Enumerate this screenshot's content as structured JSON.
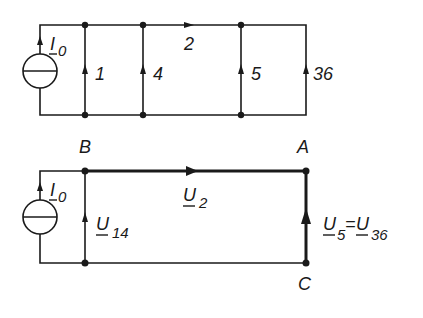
{
  "diagram": {
    "top_circuit": {
      "source_label": "I",
      "source_sub": "0",
      "branches": [
        {
          "label": "1"
        },
        {
          "label": "4"
        },
        {
          "label": "2"
        },
        {
          "label": "5"
        },
        {
          "label": "36"
        }
      ]
    },
    "bottom_circuit": {
      "source_label": "I",
      "source_sub": "0",
      "nodes": {
        "B": "B",
        "A": "A",
        "C": "C"
      },
      "u14": {
        "main": "U",
        "sub": "14"
      },
      "u2": {
        "main": "U",
        "sub": "2"
      },
      "u5": {
        "main": "U",
        "sub": "5"
      },
      "eq": "=",
      "u36": {
        "main": "U",
        "sub": "36"
      }
    },
    "colors": {
      "line": "#1a1a1a",
      "background": "#ffffff"
    }
  }
}
